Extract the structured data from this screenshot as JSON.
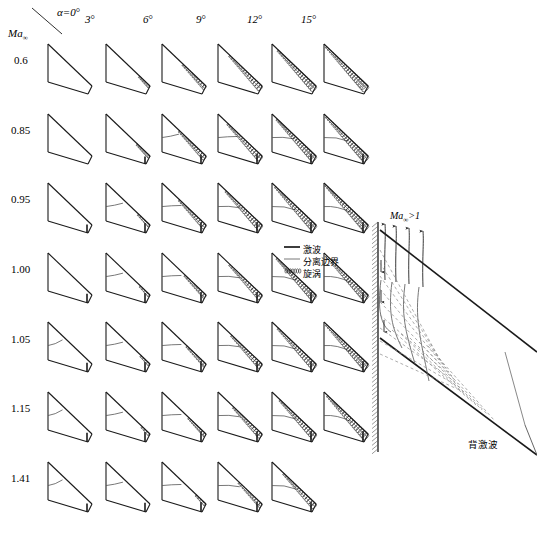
{
  "figure": {
    "axis_corner_label": "Ma",
    "axis_corner_sub": "∞",
    "column_header_first": "α=0",
    "degree_symbol": "°",
    "columns": [
      {
        "label": "α=0",
        "deg": "°",
        "alpha": 0
      },
      {
        "label": "3",
        "deg": "°",
        "alpha": 3
      },
      {
        "label": "6",
        "deg": "°",
        "alpha": 6
      },
      {
        "label": "9",
        "deg": "°",
        "alpha": 9
      },
      {
        "label": "12",
        "deg": "°",
        "alpha": 12
      },
      {
        "label": "15",
        "deg": "°",
        "alpha": 15
      }
    ],
    "rows": [
      {
        "label": "0.6",
        "mach": 0.6
      },
      {
        "label": "0.85",
        "mach": 0.85
      },
      {
        "label": "0.95",
        "mach": 0.95
      },
      {
        "label": "1.00",
        "mach": 1.0
      },
      {
        "label": "1.05",
        "mach": 1.05
      },
      {
        "label": "1.15",
        "mach": 1.15
      },
      {
        "label": "1.41",
        "mach": 1.41
      }
    ]
  },
  "legend": {
    "items": [
      {
        "symbol": "solid-thick-line",
        "label": "激波"
      },
      {
        "symbol": "solid-thin-line",
        "label": "分离边界"
      },
      {
        "symbol": "hatched-band",
        "label": "旋涡"
      }
    ]
  },
  "detail": {
    "mach_label": "Ma",
    "mach_sub": "∞",
    "mach_cond": ">1",
    "rear_shock_label": "背激波"
  },
  "colors": {
    "ink": "#1a1a1a",
    "thin": "#555555",
    "dashed": "#8a8a8a",
    "background": "#ffffff"
  },
  "chart_data": {
    "type": "table",
    "xlabel": "α (angle of attack)",
    "ylabel": "Ma∞ (free-stream Mach number)",
    "categories": [
      "α=0°",
      "3°",
      "6°",
      "9°",
      "12°",
      "15°"
    ],
    "row_categories": [
      "0.6",
      "0.85",
      "0.95",
      "1.00",
      "1.05",
      "1.15",
      "1.41"
    ],
    "legend": [
      "激波",
      "分离边界",
      "旋涡"
    ],
    "grid": false,
    "cells": [
      {
        "mach": 0.6,
        "alpha": 0,
        "vortex": 0.0,
        "shock": 0,
        "sep": 0
      },
      {
        "mach": 0.6,
        "alpha": 3,
        "vortex": 0.12,
        "shock": 0,
        "sep": 0
      },
      {
        "mach": 0.6,
        "alpha": 6,
        "vortex": 0.45,
        "shock": 0,
        "sep": 0
      },
      {
        "mach": 0.6,
        "alpha": 9,
        "vortex": 0.7,
        "shock": 0,
        "sep": 0
      },
      {
        "mach": 0.6,
        "alpha": 12,
        "vortex": 0.85,
        "shock": 0,
        "sep": 0
      },
      {
        "mach": 0.6,
        "alpha": 15,
        "vortex": 0.95,
        "shock": 0,
        "sep": 0
      },
      {
        "mach": 0.85,
        "alpha": 0,
        "vortex": 0.0,
        "shock": 0,
        "sep": 0
      },
      {
        "mach": 0.85,
        "alpha": 3,
        "vortex": 0.18,
        "shock": 0.2,
        "sep": 0
      },
      {
        "mach": 0.85,
        "alpha": 6,
        "vortex": 0.55,
        "shock": 0.4,
        "sep": 0.3
      },
      {
        "mach": 0.85,
        "alpha": 9,
        "vortex": 0.75,
        "shock": 0.5,
        "sep": 0.4
      },
      {
        "mach": 0.85,
        "alpha": 12,
        "vortex": 0.88,
        "shock": 0.5,
        "sep": 0.5
      },
      {
        "mach": 0.85,
        "alpha": 15,
        "vortex": 0.95,
        "shock": 0.5,
        "sep": 0.6
      },
      {
        "mach": 0.95,
        "alpha": 0,
        "vortex": 0.0,
        "shock": 0.3,
        "sep": 0
      },
      {
        "mach": 0.95,
        "alpha": 3,
        "vortex": 0.15,
        "shock": 0.5,
        "sep": 0.3
      },
      {
        "mach": 0.95,
        "alpha": 6,
        "vortex": 0.55,
        "shock": 0.6,
        "sep": 0.4
      },
      {
        "mach": 0.95,
        "alpha": 9,
        "vortex": 0.8,
        "shock": 0.6,
        "sep": 0.5
      },
      {
        "mach": 0.95,
        "alpha": 12,
        "vortex": 0.92,
        "shock": 0.6,
        "sep": 0.6
      },
      {
        "mach": 0.95,
        "alpha": 15,
        "vortex": 0.97,
        "shock": 0.6,
        "sep": 0.7
      },
      {
        "mach": 1.0,
        "alpha": 0,
        "vortex": 0.0,
        "shock": 0.4,
        "sep": 0
      },
      {
        "mach": 1.0,
        "alpha": 3,
        "vortex": 0.1,
        "shock": 0.5,
        "sep": 0.3
      },
      {
        "mach": 1.0,
        "alpha": 6,
        "vortex": 0.4,
        "shock": 0.6,
        "sep": 0.4
      },
      {
        "mach": 1.0,
        "alpha": 9,
        "vortex": 0.7,
        "shock": 0.6,
        "sep": 0.5
      },
      {
        "mach": 1.0,
        "alpha": 12,
        "vortex": 0.88,
        "shock": 0.6,
        "sep": 0.6
      },
      {
        "mach": 1.0,
        "alpha": 15,
        "vortex": 0.95,
        "shock": 0.6,
        "sep": 0.7
      },
      {
        "mach": 1.05,
        "alpha": 0,
        "vortex": 0.0,
        "shock": 0.4,
        "sep": 0.2
      },
      {
        "mach": 1.05,
        "alpha": 3,
        "vortex": 0.08,
        "shock": 0.5,
        "sep": 0.3
      },
      {
        "mach": 1.05,
        "alpha": 6,
        "vortex": 0.35,
        "shock": 0.6,
        "sep": 0.4
      },
      {
        "mach": 1.05,
        "alpha": 9,
        "vortex": 0.65,
        "shock": 0.6,
        "sep": 0.5
      },
      {
        "mach": 1.05,
        "alpha": 12,
        "vortex": 0.85,
        "shock": 0.6,
        "sep": 0.6
      },
      {
        "mach": 1.05,
        "alpha": 15,
        "vortex": 0.95,
        "shock": 0.6,
        "sep": 0.7
      },
      {
        "mach": 1.15,
        "alpha": 0,
        "vortex": 0.0,
        "shock": 0.4,
        "sep": 0.2
      },
      {
        "mach": 1.15,
        "alpha": 3,
        "vortex": 0.05,
        "shock": 0.5,
        "sep": 0.3
      },
      {
        "mach": 1.15,
        "alpha": 6,
        "vortex": 0.3,
        "shock": 0.6,
        "sep": 0.4
      },
      {
        "mach": 1.15,
        "alpha": 9,
        "vortex": 0.6,
        "shock": 0.6,
        "sep": 0.5
      },
      {
        "mach": 1.15,
        "alpha": 12,
        "vortex": 0.8,
        "shock": 0.6,
        "sep": 0.6
      },
      {
        "mach": 1.15,
        "alpha": 15,
        "vortex": 0.92,
        "shock": 0.6,
        "sep": 0.7
      },
      {
        "mach": 1.41,
        "alpha": 0,
        "vortex": 0.0,
        "shock": 0.3,
        "sep": 0.2
      },
      {
        "mach": 1.41,
        "alpha": 3,
        "vortex": 0.0,
        "shock": 0.4,
        "sep": 0.3
      },
      {
        "mach": 1.41,
        "alpha": 6,
        "vortex": 0.1,
        "shock": 0.5,
        "sep": 0.4
      },
      {
        "mach": 1.41,
        "alpha": 9,
        "vortex": 0.45,
        "shock": 0.5,
        "sep": 0.5
      },
      {
        "mach": 1.41,
        "alpha": 12,
        "vortex": 0.7,
        "shock": 0.5,
        "sep": 0.6
      },
      {
        "mach": 1.41,
        "alpha": 15,
        "vortex": 0.0,
        "shock": 0.0,
        "sep": 0.0
      }
    ]
  }
}
